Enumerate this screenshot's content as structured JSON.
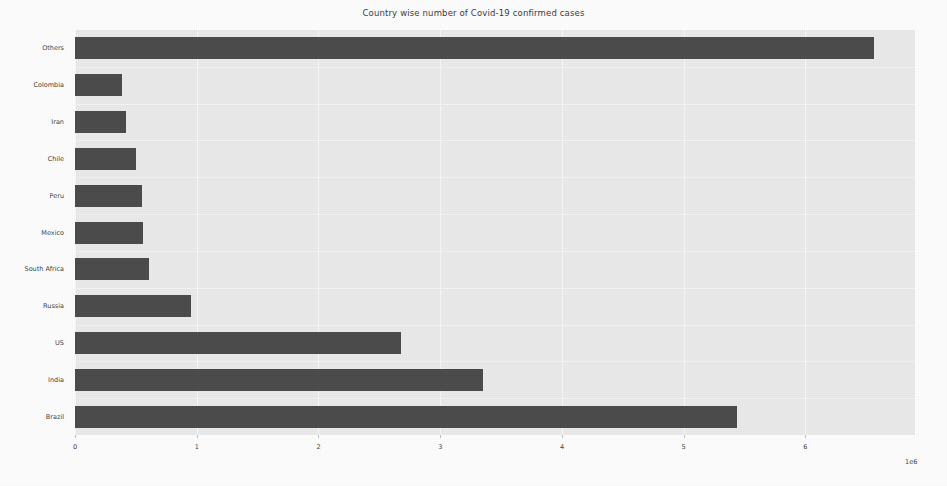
{
  "chart_data": {
    "type": "bar",
    "orientation": "horizontal",
    "title": "Country wise number of Covid-19 confirmed cases",
    "xlabel": "",
    "ylabel": "",
    "categories": [
      "Brazil",
      "India",
      "US",
      "Russia",
      "South Africa",
      "Mexico",
      "Peru",
      "Chile",
      "Iran",
      "Colombia",
      "Others"
    ],
    "values": [
      5440000,
      3350000,
      2680000,
      950000,
      610000,
      560000,
      550000,
      500000,
      420000,
      390000,
      6560000
    ],
    "xlim": [
      0,
      6900000
    ],
    "xtick_labels": [
      "0",
      "1",
      "2",
      "3",
      "4",
      "5",
      "6"
    ],
    "xtick_values": [
      0,
      1000000,
      2000000,
      3000000,
      4000000,
      5000000,
      6000000
    ],
    "x_exponent_label": "1e6",
    "grid": true,
    "legend": "none",
    "bar_color": "#4a4a4a",
    "plot_background": "#eaeaea",
    "figure_background": "#fdfdfd"
  },
  "axes": {
    "y_tick_labels": [
      "Others",
      "Colombia",
      "Iran",
      "Chile",
      "Peru",
      "Mexico",
      "South Africa",
      "Russia",
      "US",
      "India",
      "Brazil"
    ]
  }
}
